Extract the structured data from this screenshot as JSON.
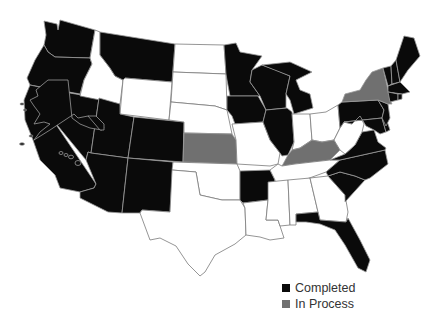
{
  "colors": {
    "completed": "#0a0a0a",
    "in_process": "#707070",
    "none": "#ffffff"
  },
  "legend": {
    "items": [
      {
        "label": "Completed",
        "status": "completed",
        "color": "#0a0a0a"
      },
      {
        "label": "In Process",
        "status": "in_process",
        "color": "#707070"
      }
    ]
  },
  "states": {
    "completed": [
      "WA",
      "OR",
      "CA",
      "NV",
      "UT",
      "AZ",
      "MT",
      "CO",
      "NM",
      "MN",
      "WI",
      "IA",
      "IL",
      "MI",
      "AR",
      "PA",
      "NJ",
      "DE",
      "MD",
      "VA",
      "NC",
      "SC",
      "FL",
      "ME",
      "NH",
      "VT",
      "MA",
      "CT",
      "RI",
      "AK",
      "HI"
    ],
    "in_process": [
      "KS",
      "KY",
      "NY"
    ],
    "none": [
      "ID",
      "WY",
      "ND",
      "SD",
      "NE",
      "OK",
      "TX",
      "MO",
      "LA",
      "MS",
      "AL",
      "GA",
      "TN",
      "IN",
      "OH",
      "WV"
    ]
  }
}
